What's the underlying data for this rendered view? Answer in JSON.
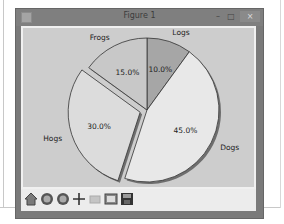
{
  "window": {
    "title": "Figure 1",
    "controls": {
      "minimize": "–",
      "maximize": "□",
      "close": "×"
    }
  },
  "toolbar": {
    "buttons": [
      {
        "name": "home",
        "icon": "home-icon"
      },
      {
        "name": "back",
        "icon": "back-icon"
      },
      {
        "name": "forward",
        "icon": "forward-icon"
      },
      {
        "name": "pan",
        "icon": "pan-icon"
      },
      {
        "name": "zoom",
        "icon": "zoom-icon"
      },
      {
        "name": "configure-subplots",
        "icon": "subplots-icon"
      },
      {
        "name": "save",
        "icon": "save-icon"
      }
    ]
  },
  "chart_data": {
    "type": "pie",
    "title": "",
    "labels": [
      "Logs",
      "Dogs",
      "Hogs",
      "Frogs"
    ],
    "values": [
      10,
      45,
      30,
      15
    ],
    "value_labels": [
      "10.0%",
      "45.0%",
      "30.0%",
      "15.0%"
    ],
    "explode": [
      0,
      0,
      0.1,
      0
    ],
    "startangle": 90,
    "direction": "clockwise",
    "colors": [
      "#a6a6a6",
      "#e8e8e8",
      "#dcdcdc",
      "#c8c8c8"
    ],
    "shadow": true
  }
}
